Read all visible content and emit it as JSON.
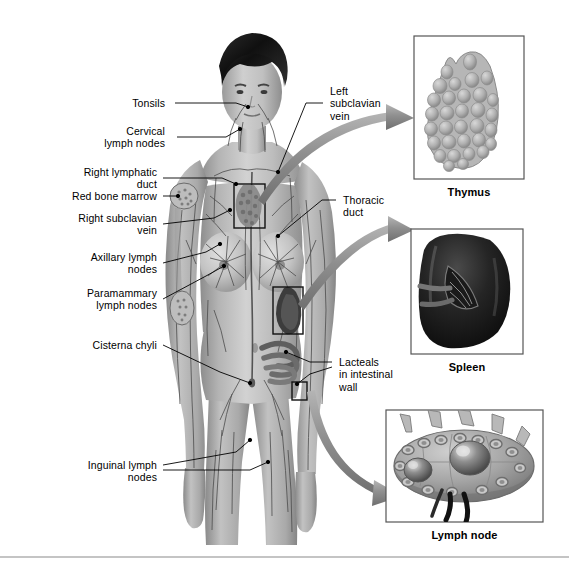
{
  "figure": {
    "number": "",
    "background_color": "#ffffff",
    "line_color": "#000000",
    "arrow_color": "#8d8d8d",
    "panel_border_color": "#5a5a5a"
  },
  "labels_left": [
    {
      "id": "tonsils",
      "text": "Tonsils",
      "align": "right"
    },
    {
      "id": "cervical-lymph-nodes",
      "text": "Cervical\nlymph nodes",
      "align": "right"
    },
    {
      "id": "right-lymphatic-duct",
      "text": "Right lymphatic\nduct",
      "align": "right"
    },
    {
      "id": "red-bone-marrow",
      "text": "Red bone marrow",
      "align": "right"
    },
    {
      "id": "right-subclavian-vein",
      "text": "Right subclavian\nvein",
      "align": "right"
    },
    {
      "id": "axillary-lymph-nodes",
      "text": "Axillary lymph\nnodes",
      "align": "right"
    },
    {
      "id": "paramammary-lymph-nodes",
      "text": "Paramammary\nlymph nodes",
      "align": "right"
    },
    {
      "id": "cisterna-chyli",
      "text": "Cisterna chyli",
      "align": "right"
    },
    {
      "id": "inguinal-lymph-nodes",
      "text": "Inguinal lymph\nnodes",
      "align": "right"
    }
  ],
  "labels_right": [
    {
      "id": "left-subclavian-vein",
      "text": "Left\nsubclavian\nvein",
      "align": "left"
    },
    {
      "id": "thoracic-duct",
      "text": "Thoracic\nduct",
      "align": "left"
    },
    {
      "id": "lacteals",
      "text": "Lacteals\nin intestinal\nwall",
      "align": "left"
    }
  ],
  "insets": [
    {
      "id": "thymus",
      "caption": "Thymus"
    },
    {
      "id": "spleen",
      "caption": "Spleen"
    },
    {
      "id": "lymph-node",
      "caption": "Lymph node"
    }
  ]
}
